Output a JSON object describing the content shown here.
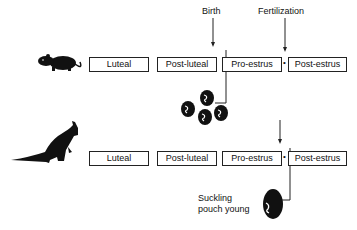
{
  "diagram": {
    "title_labels": {
      "birth": "Birth",
      "fertilization": "Fertilization"
    },
    "rows": [
      {
        "animal": "rodent-like placental mammal",
        "phases": [
          "Luteal",
          "Post-luteal",
          "Pro-estrus",
          "Post-estrus"
        ],
        "offspring": "litter of neonates"
      },
      {
        "animal": "wallaby (marsupial)",
        "phases": [
          "Luteal",
          "Post-luteal",
          "Pro-estrus",
          "Post-estrus"
        ],
        "offspring": "single pouch young"
      }
    ],
    "offspring_label_line1": "Suckling",
    "offspring_label_line2": "pouch young",
    "separator_marker": "•"
  }
}
